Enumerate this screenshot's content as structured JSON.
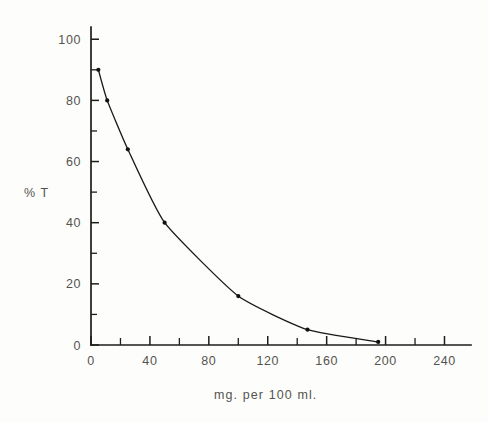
{
  "chart_data": {
    "type": "line",
    "title": "",
    "subtitle": "",
    "xlabel": "mg. per  100 ml.",
    "ylabel": "% T",
    "xlim": [
      0,
      258
    ],
    "ylim": [
      0,
      104
    ],
    "grid": false,
    "legend": null,
    "x_major_ticks": [
      0,
      40,
      80,
      120,
      160,
      200,
      240
    ],
    "x_major_tick_labels": [
      "0",
      "40",
      "80",
      "120",
      "160",
      "200",
      "240"
    ],
    "x_minor_ticks": [
      20,
      60,
      100,
      140,
      180,
      220
    ],
    "y_major_ticks": [
      0,
      20,
      40,
      60,
      80,
      100
    ],
    "y_major_tick_labels": [
      "0",
      "20",
      "40",
      "60",
      "80",
      "100"
    ],
    "y_minor_ticks": [
      10,
      30,
      50,
      70,
      90
    ],
    "series": [
      {
        "name": "transmittance",
        "x": [
          5,
          11,
          25,
          50,
          100,
          147,
          195
        ],
        "values": [
          90,
          80,
          64,
          40,
          16,
          5,
          1
        ],
        "marker": "dot",
        "color": "#19191a"
      }
    ],
    "annotations": []
  },
  "axes": {
    "y_axis_title": "% T",
    "x_axis_title": "mg. per  100 ml."
  },
  "style": {
    "background": "#fdfdfb",
    "ink": "#1d1d1b",
    "text": "#54544f",
    "curve": "#19191a"
  }
}
